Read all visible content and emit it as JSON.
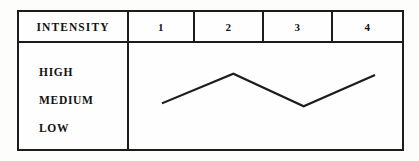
{
  "table": {
    "header_label": "INTENSITY",
    "columns": [
      "1",
      "2",
      "3",
      "4"
    ],
    "row_labels": [
      "HIGH",
      "MEDIUM",
      "LOW"
    ]
  },
  "chart_data": {
    "type": "line",
    "title": "INTENSITY",
    "xlabel": "",
    "ylabel": "INTENSITY",
    "categories": [
      "1",
      "2",
      "3",
      "4"
    ],
    "x": [
      1,
      2,
      3,
      4
    ],
    "ytick_labels": [
      "HIGH",
      "MEDIUM",
      "LOW"
    ],
    "ylim": [
      "LOW",
      "HIGH"
    ],
    "values": [
      "MEDIUM",
      "HIGH",
      "MEDIUM",
      "HIGH"
    ],
    "numeric_values": [
      2.0,
      2.85,
      1.9,
      2.8
    ],
    "grid": false,
    "legend": "none",
    "series": [
      {
        "name": "intensity",
        "values": [
          2.0,
          2.85,
          1.9,
          2.8
        ],
        "color": "#1c1c1c"
      }
    ],
    "annotations": []
  },
  "style": {
    "line_color": "#1c1c1c",
    "border_color": "#1c1c1c",
    "text_color": "#131313",
    "background": "#fdfdfc"
  }
}
